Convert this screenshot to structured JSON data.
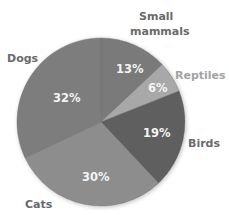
{
  "chart_data": {
    "type": "pie",
    "title": "",
    "categories": [
      "Small mammals",
      "Reptiles",
      "Birds",
      "Cats",
      "Dogs"
    ],
    "values": [
      13,
      6,
      19,
      30,
      32
    ],
    "value_labels": [
      "13%",
      "6%",
      "19%",
      "30%",
      "32%"
    ],
    "start_angle_deg": -90,
    "direction": "clockwise",
    "legend": "none (direct labels outside slices)",
    "colors": {
      "Small mammals": "#7a7a7a",
      "Reptiles": "#a8a8a8",
      "Birds": "#5e5e5e",
      "Cats": "#8d8d8d",
      "Dogs": "#7d7d7d"
    }
  },
  "labels": {
    "small_mammals_line1": "Small",
    "small_mammals_line2": "mammals",
    "reptiles": "Reptiles",
    "birds": "Birds",
    "cats": "Cats",
    "dogs": "Dogs",
    "pct_small_mammals": "13%",
    "pct_reptiles": "6%",
    "pct_birds": "19%",
    "pct_cats": "30%",
    "pct_dogs": "32%"
  },
  "style": {
    "label_color": "#6a6a6a",
    "reptiles_label_color": "#a3a3a3",
    "pct_color": "#f4f4f4"
  }
}
